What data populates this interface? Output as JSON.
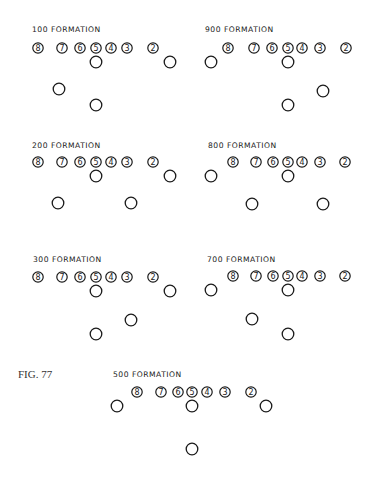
{
  "figure_label": "FIG. 77",
  "diagram": {
    "type": "football-formations",
    "stroke_color": "#1a1a1a",
    "background": "#ffffff",
    "line_numbers": [
      "8",
      "7",
      "6",
      "5",
      "4",
      "3",
      "2"
    ],
    "formations": [
      {
        "id": "f100",
        "title": "100 FORMATION",
        "title_pos": [
          32,
          32
        ],
        "line_y": 48,
        "line_x": [
          38,
          62,
          80,
          96,
          111,
          127,
          153
        ],
        "backs": [
          [
            96,
            62
          ],
          [
            170,
            62
          ],
          [
            59,
            89
          ],
          [
            96,
            105
          ]
        ]
      },
      {
        "id": "f900",
        "title": "900 FORMATION",
        "title_pos": [
          205,
          32
        ],
        "line_y": 48,
        "line_x": [
          228,
          254,
          272,
          288,
          302,
          320,
          346
        ],
        "backs": [
          [
            211,
            62
          ],
          [
            288,
            62
          ],
          [
            323,
            91
          ],
          [
            288,
            105
          ]
        ]
      },
      {
        "id": "f200",
        "title": "200 FORMATION",
        "title_pos": [
          32,
          148
        ],
        "line_y": 162,
        "line_x": [
          38,
          62,
          80,
          96,
          111,
          127,
          153
        ],
        "backs": [
          [
            96,
            176
          ],
          [
            170,
            176
          ],
          [
            58,
            203
          ],
          [
            131,
            203
          ]
        ]
      },
      {
        "id": "f800",
        "title": "800 FORMATION",
        "title_pos": [
          208,
          148
        ],
        "line_y": 162,
        "line_x": [
          233,
          256,
          273,
          288,
          302,
          320,
          345
        ],
        "backs": [
          [
            211,
            176
          ],
          [
            288,
            176
          ],
          [
            252,
            204
          ],
          [
            323,
            204
          ]
        ]
      },
      {
        "id": "f300",
        "title": "300 FORMATION",
        "title_pos": [
          33,
          262
        ],
        "line_y": 277,
        "line_x": [
          38,
          62,
          80,
          96,
          111,
          127,
          153
        ],
        "backs": [
          [
            96,
            291
          ],
          [
            170,
            291
          ],
          [
            131,
            320
          ],
          [
            96,
            334
          ]
        ]
      },
      {
        "id": "f700",
        "title": "700 FORMATION",
        "title_pos": [
          207,
          262
        ],
        "line_y": 276,
        "line_x": [
          233,
          256,
          273,
          288,
          302,
          320,
          345
        ],
        "backs": [
          [
            211,
            290
          ],
          [
            288,
            290
          ],
          [
            252,
            319
          ],
          [
            288,
            334
          ]
        ]
      },
      {
        "id": "f500",
        "title": "500 FORMATION",
        "title_pos": [
          113,
          377
        ],
        "line_y": 392,
        "line_x": [
          137,
          161,
          178,
          192,
          207,
          225,
          251
        ],
        "backs": [
          [
            117,
            406
          ],
          [
            192,
            406
          ],
          [
            266,
            406
          ],
          [
            192,
            449
          ]
        ]
      }
    ]
  }
}
